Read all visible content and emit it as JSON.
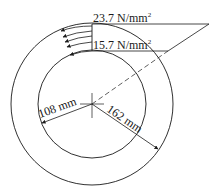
{
  "diagram": {
    "type": "hollow-shaft-shear-stress-distribution",
    "colors": {
      "line": "#1a1a1a",
      "background": "#ffffff"
    },
    "labels": {
      "max_stress_value": "23.7 N/mm",
      "max_stress_sup": "2",
      "min_stress_value": "15.7 N/mm",
      "min_stress_sup": "2",
      "inner_dim": "108 mm",
      "outer_dim": "162 mm"
    }
  }
}
